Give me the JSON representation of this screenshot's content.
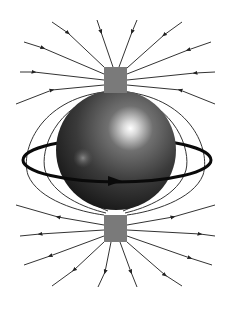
{
  "diagram": {
    "title": "",
    "colors": {
      "background": "#ffffff",
      "field_line": "#3a3a3a",
      "magnet_block": "#7a7a7a",
      "sphere_dark": "#1e1e1e",
      "sphere_mid": "#5a5a5a",
      "highlight": "#ffffff",
      "ring": "#0a0a0a"
    },
    "elements": [
      {
        "id": "sphere",
        "shape": "sphere",
        "cx": 116,
        "cy": 150,
        "r": 60
      },
      {
        "id": "top-magnet",
        "shape": "rect",
        "x": 104,
        "y": 67,
        "w": 23,
        "h": 26
      },
      {
        "id": "bottom-magnet",
        "shape": "rect",
        "x": 104,
        "y": 215,
        "w": 23,
        "h": 27
      },
      {
        "id": "current-ring",
        "shape": "ellipse",
        "cx": 117,
        "cy": 160,
        "rx": 94,
        "ry": 22,
        "arrow_direction": "right (front)"
      }
    ],
    "field_lines": {
      "top_incoming_count": 10,
      "bottom_outgoing_count": 10,
      "side_loops_per_side": 3
    }
  }
}
